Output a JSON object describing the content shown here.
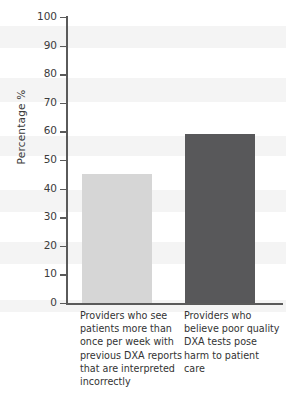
{
  "chart_data": {
    "type": "bar",
    "title": "",
    "xlabel": "",
    "ylabel": "Percentage %",
    "ylim": [
      0,
      100
    ],
    "ytick_values": [
      0,
      10,
      20,
      30,
      40,
      50,
      60,
      70,
      80,
      90,
      100
    ],
    "ytick_labels": [
      "0",
      "10",
      "20",
      "30",
      "40",
      "50",
      "60",
      "70",
      "80",
      "90",
      "100"
    ],
    "grid": false,
    "legend": false,
    "categories": [
      "Providers who see patients more than once per week with previous DXA reports that are interpreted incorrectly",
      "Providers who believe poor quality DXA tests pose harm to patient care"
    ],
    "values": [
      45,
      59
    ],
    "bar_colors": [
      "#d6d6d6",
      "#58585a"
    ]
  },
  "axes": {
    "y_label": "Percentage %",
    "y_ticks": [
      {
        "label": "100",
        "value": 100
      },
      {
        "label": "90",
        "value": 90
      },
      {
        "label": "80",
        "value": 80
      },
      {
        "label": "70",
        "value": 70
      },
      {
        "label": "60",
        "value": 60
      },
      {
        "label": "50",
        "value": 50
      },
      {
        "label": "40",
        "value": 40
      },
      {
        "label": "30",
        "value": 30
      },
      {
        "label": "20",
        "value": 20
      },
      {
        "label": "10",
        "value": 10
      },
      {
        "label": "0",
        "value": 0
      }
    ]
  },
  "bars": [
    {
      "label": "Providers who see patients more than once per week with previous DXA reports that are interpreted incorrectly",
      "value": 45,
      "color": "#d6d6d6"
    },
    {
      "label": "Providers who believe poor quality DXA tests pose harm to patient care",
      "value": 59,
      "color": "#58585a"
    }
  ]
}
